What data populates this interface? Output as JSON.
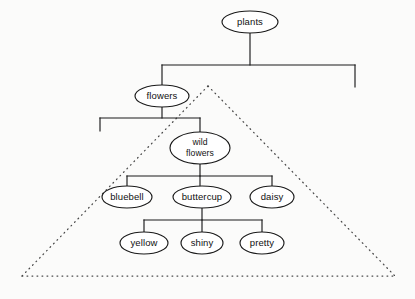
{
  "diagram": {
    "type": "tree",
    "background_color": "#fbfbfa",
    "node_fill": "#ffffff",
    "node_stroke": "#1a1a1a",
    "edge_color": "#1a1a1a",
    "dotted_color": "#4a4a4a",
    "nodes": {
      "plants": {
        "label": "plants",
        "cx": 250,
        "cy": 22,
        "rx": 28,
        "ry": 11
      },
      "flowers": {
        "label": "flowers",
        "cx": 162,
        "cy": 96,
        "rx": 27,
        "ry": 11
      },
      "wild_flowers": {
        "label_line1": "wild",
        "label_line2": "flowers",
        "cx": 200,
        "cy": 148,
        "rx": 30,
        "ry": 16
      },
      "bluebell": {
        "label": "bluebell",
        "cx": 127,
        "cy": 197,
        "rx": 25,
        "ry": 11
      },
      "buttercup": {
        "label": "buttercup",
        "cx": 202,
        "cy": 197,
        "rx": 29,
        "ry": 11
      },
      "daisy": {
        "label": "daisy",
        "cx": 272,
        "cy": 197,
        "rx": 22,
        "ry": 11
      },
      "yellow": {
        "label": "yellow",
        "cx": 144,
        "cy": 243,
        "rx": 24,
        "ry": 11
      },
      "shiny": {
        "label": "shiny",
        "cx": 202,
        "cy": 243,
        "rx": 21,
        "ry": 11
      },
      "pretty": {
        "label": "pretty",
        "cx": 262,
        "cy": 243,
        "rx": 22,
        "ry": 11
      }
    },
    "edges": [
      {
        "from": "plants",
        "to": "flowers",
        "kind": "orthogonal"
      },
      {
        "from": "plants",
        "to": "dangling-right",
        "kind": "orthogonal-stub"
      },
      {
        "from": "flowers",
        "to": "dangling-left",
        "kind": "orthogonal-stub"
      },
      {
        "from": "flowers",
        "to": "wild_flowers",
        "kind": "orthogonal"
      },
      {
        "from": "wild_flowers",
        "to": "bluebell",
        "kind": "orthogonal"
      },
      {
        "from": "wild_flowers",
        "to": "buttercup",
        "kind": "orthogonal"
      },
      {
        "from": "wild_flowers",
        "to": "daisy",
        "kind": "orthogonal"
      },
      {
        "from": "buttercup",
        "to": "yellow",
        "kind": "orthogonal"
      },
      {
        "from": "buttercup",
        "to": "shiny",
        "kind": "orthogonal"
      },
      {
        "from": "buttercup",
        "to": "pretty",
        "kind": "orthogonal"
      }
    ],
    "overlay": {
      "name": "dotted-triangle",
      "style": "dotted",
      "apex": {
        "x": 208,
        "y": 86
      },
      "base_left": {
        "x": 22,
        "y": 276
      },
      "base_right": {
        "x": 395,
        "y": 276
      }
    }
  }
}
